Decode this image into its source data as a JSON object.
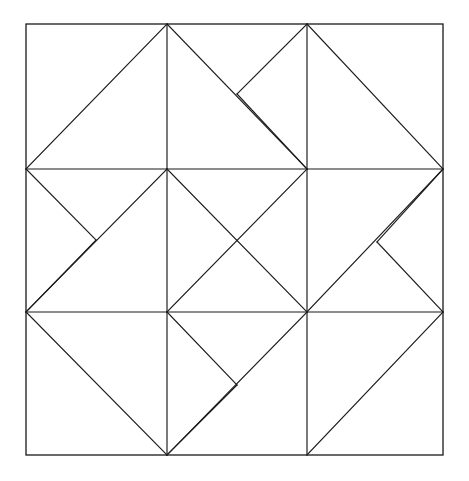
{
  "figure": {
    "canvas": {
      "width": 469,
      "height": 481
    },
    "background_color": "#ffffff",
    "stroke_color": "#1a1a1a",
    "stroke_width": 1.15,
    "frame_stroke_width": 1.3,
    "grid": {
      "x": [
        26,
        167,
        307,
        443
      ],
      "y": [
        24,
        169,
        312,
        455
      ]
    },
    "notch_points": [
      {
        "name": "top-right-notch",
        "x": 237,
        "y": 94
      },
      {
        "name": "middle-right-notch",
        "x": 377,
        "y": 242
      },
      {
        "name": "bottom-middle-notch",
        "x": 237,
        "y": 385
      },
      {
        "name": "middle-left-notch",
        "x": 96,
        "y": 240
      }
    ],
    "frame": {
      "name": "outer-square",
      "x": 26,
      "y": 24,
      "width": 417,
      "height": 431
    },
    "grid_lines": [
      {
        "name": "horizontal-upper",
        "x1": 26,
        "y1": 169,
        "x2": 443,
        "y2": 169
      },
      {
        "name": "horizontal-lower",
        "x1": 26,
        "y1": 312,
        "x2": 443,
        "y2": 312
      },
      {
        "name": "vertical-left-top",
        "x1": 167,
        "y1": 24,
        "x2": 167,
        "y2": 169
      },
      {
        "name": "vertical-right-top",
        "x1": 307,
        "y1": 24,
        "x2": 307,
        "y2": 169
      },
      {
        "name": "vertical-left-middle",
        "x1": 167,
        "y1": 169,
        "x2": 167,
        "y2": 312
      },
      {
        "name": "vertical-right-middle",
        "x1": 307,
        "y1": 169,
        "x2": 307,
        "y2": 312
      },
      {
        "name": "vertical-left-bottom",
        "x1": 167,
        "y1": 312,
        "x2": 167,
        "y2": 455
      },
      {
        "name": "vertical-right-bottom",
        "x1": 307,
        "y1": 312,
        "x2": 307,
        "y2": 455
      }
    ],
    "diagonals": [
      {
        "name": "diag-topleft-cell-left",
        "x1": 26,
        "y1": 169,
        "x2": 167,
        "y2": 24
      },
      {
        "name": "diag-topmid-cell-right",
        "x1": 167,
        "y1": 24,
        "x2": 307,
        "y2": 169
      },
      {
        "name": "diag-topright-notch-upper",
        "x1": 307,
        "y1": 24,
        "x2": 237,
        "y2": 94
      },
      {
        "name": "diag-topright-notch-lower",
        "x1": 237,
        "y1": 94,
        "x2": 307,
        "y2": 169
      },
      {
        "name": "diag-topright-cell-right",
        "x1": 307,
        "y1": 24,
        "x2": 443,
        "y2": 169
      },
      {
        "name": "diag-midleft-notch",
        "x1": 26,
        "y1": 169,
        "x2": 96,
        "y2": 240
      },
      {
        "name": "diag-midleft-notch-down",
        "x1": 96,
        "y1": 240,
        "x2": 26,
        "y2": 312
      },
      {
        "name": "diag-midleft-full",
        "x1": 167,
        "y1": 169,
        "x2": 26,
        "y2": 312
      },
      {
        "name": "diag-center-down-right",
        "x1": 167,
        "y1": 169,
        "x2": 307,
        "y2": 312
      },
      {
        "name": "diag-center-up-right",
        "x1": 167,
        "y1": 312,
        "x2": 307,
        "y2": 169
      },
      {
        "name": "diag-midright-notch-upper",
        "x1": 443,
        "y1": 169,
        "x2": 377,
        "y2": 242
      },
      {
        "name": "diag-midright-notch-lower",
        "x1": 377,
        "y1": 242,
        "x2": 443,
        "y2": 312
      },
      {
        "name": "diag-midright-full",
        "x1": 307,
        "y1": 312,
        "x2": 443,
        "y2": 169
      },
      {
        "name": "diag-botleft-full",
        "x1": 26,
        "y1": 312,
        "x2": 167,
        "y2": 455
      },
      {
        "name": "diag-botmid-notch-upper",
        "x1": 167,
        "y1": 312,
        "x2": 237,
        "y2": 385
      },
      {
        "name": "diag-botmid-notch-lower",
        "x1": 237,
        "y1": 385,
        "x2": 167,
        "y2": 455
      },
      {
        "name": "diag-botmid-right",
        "x1": 307,
        "y1": 312,
        "x2": 167,
        "y2": 455
      },
      {
        "name": "diag-botright-full",
        "x1": 307,
        "y1": 455,
        "x2": 443,
        "y2": 312
      }
    ]
  }
}
